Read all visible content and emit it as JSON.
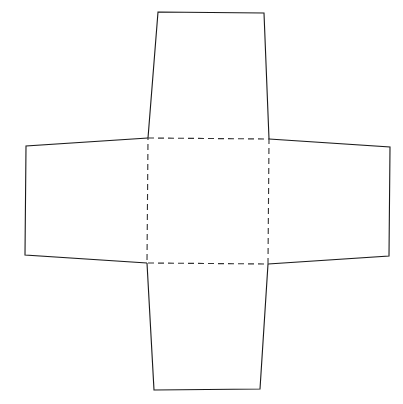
{
  "diagram": {
    "type": "net",
    "colors": {
      "background": "#ffffff",
      "stroke": "#1a1a1a",
      "fold": "#333333"
    },
    "base": {
      "points": "148,138 269,139 268,264 147,263",
      "line_style": "dashed"
    },
    "flaps": [
      {
        "name": "top",
        "points": "148,138 158,12 264,13 269,139"
      },
      {
        "name": "left",
        "points": "148,138 26,146 25,255 147,263"
      },
      {
        "name": "right",
        "points": "269,139 390,147 389,256 268,264"
      },
      {
        "name": "bottom",
        "points": "147,263 154,390 260,389 268,264"
      }
    ]
  }
}
